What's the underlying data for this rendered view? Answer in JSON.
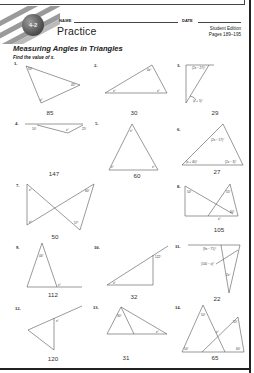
{
  "header": {
    "lesson_badge": "4-2",
    "name_label": "NAME",
    "date_label": "DATE",
    "worksheet_type": "Practice",
    "edition": "Student Edition",
    "pages": "Pages 189–195",
    "lesson_title": "Measuring Angles in Triangles",
    "instructions": "Find the value of x."
  },
  "problems": [
    {
      "number": "1.",
      "labels": [
        "50°",
        "45°",
        "x°"
      ],
      "answer": "85"
    },
    {
      "number": "2.",
      "labels": [
        "4x°",
        "x°",
        "x°"
      ],
      "answer": "30"
    },
    {
      "number": "3.",
      "labels": [
        "(2x − 27)°",
        "(x + 5)°"
      ],
      "answer": "29"
    },
    {
      "number": "4.",
      "labels": [
        "10°",
        "x°",
        "25°"
      ],
      "answer": "147"
    },
    {
      "number": "5.",
      "labels": [
        "x°",
        "x°",
        "x°"
      ],
      "answer": "60"
    },
    {
      "number": "6.",
      "labels": [
        "(2x − 17)°",
        "(x + 40)°",
        "(2x − 3)°"
      ],
      "answer": "27"
    },
    {
      "number": "7.",
      "labels": [
        "x°",
        "60°",
        "x°",
        "57°"
      ],
      "answer": "50"
    },
    {
      "number": "8.",
      "labels": [
        "50°",
        "55°",
        "60°",
        "x°"
      ],
      "answer": "105"
    },
    {
      "number": "9.",
      "labels": [
        "44°",
        "x°"
      ],
      "answer": "112"
    },
    {
      "number": "10.",
      "labels": [
        "122°",
        "x°"
      ],
      "answer": "32"
    },
    {
      "number": "11.",
      "labels": [
        "(9x − 71)°",
        "(100 − x)°",
        "2x°"
      ],
      "answer": "22"
    },
    {
      "number": "12.",
      "labels": [
        "x°"
      ],
      "answer": "120"
    },
    {
      "number": "13.",
      "labels": [
        "30°",
        "x°"
      ],
      "answer": "31"
    },
    {
      "number": "14.",
      "labels": [
        "50°",
        "55°",
        "x°",
        "50°",
        "60°"
      ],
      "answer": "65"
    }
  ]
}
